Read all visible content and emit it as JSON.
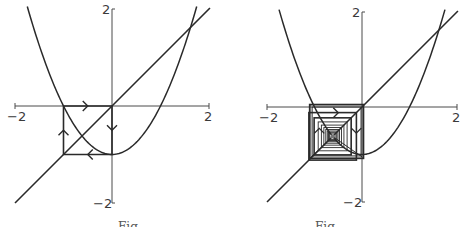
{
  "figure": {
    "function": "f(x) = x^2 - 1",
    "stroke_color": "#2a2a2a",
    "axis_color": "#4a4a4a",
    "panels": [
      {
        "id": "left",
        "title": "period-2 cycle cobweb",
        "origin_px": [
          112,
          106
        ],
        "scale_px_per_unit": 48.5,
        "axis_range": [
          -2,
          2
        ],
        "tick_labels": {
          "x_min": "−2",
          "x_max": "2",
          "y_max": "2",
          "y_min": "−2"
        },
        "cobweb": {
          "type": "cycle",
          "points": [
            [
              -1,
              0
            ],
            [
              0,
              0
            ],
            [
              0,
              -1
            ],
            [
              -1,
              -1
            ]
          ]
        },
        "arrows": [
          {
            "x": -0.5,
            "y": 0,
            "dir": "right"
          },
          {
            "x": 0,
            "y": -0.5,
            "dir": "down"
          },
          {
            "x": -0.5,
            "y": -1,
            "dir": "left"
          },
          {
            "x": -1,
            "y": -0.5,
            "dir": "up"
          }
        ],
        "caption": "Fig."
      },
      {
        "id": "right",
        "title": "nested cobweb converging",
        "origin_px": [
          362,
          107
        ],
        "scale_px_per_unit": 47.5,
        "axis_range": [
          -2,
          2
        ],
        "tick_labels": {
          "x_min": "−2",
          "x_max": "2",
          "y_max": "2",
          "y_min": "−2"
        },
        "cobweb": {
          "type": "nested",
          "center": [
            -0.618,
            -0.618
          ],
          "outer_half": 0.5,
          "count": 9
        },
        "arrows": [
          {
            "x": -0.5,
            "y": -0.12,
            "dir": "right"
          },
          {
            "x": -0.12,
            "y": -0.55,
            "dir": "down"
          },
          {
            "x": -0.9,
            "y": -0.45,
            "dir": "up"
          }
        ],
        "caption": "Fig."
      }
    ]
  }
}
